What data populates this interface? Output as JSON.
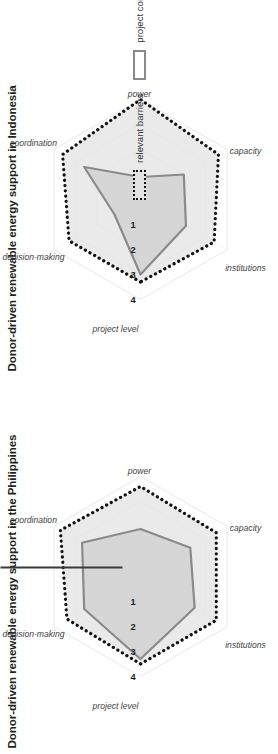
{
  "figure": {
    "background": "#ffffff",
    "orientation_note": "rotated",
    "divider": {
      "name": "panel-divider",
      "color": "#3a3a3a"
    }
  },
  "legend": {
    "items": [
      {
        "label": "relevant barriers",
        "swatch": "dotted-outline-square",
        "fill": "#e3e3e3",
        "stroke": "#111111"
      },
      {
        "label": "project contributions",
        "swatch": "solid-outline-square",
        "fill": "#ffffff",
        "stroke": "#8a8a8a"
      }
    ]
  },
  "panels": [
    {
      "id": "indonesia",
      "title": "Donor-driven renewable energy support in Indonesia"
    },
    {
      "id": "philippines",
      "title": "Donor-driven renewable energy support in the Philippines"
    }
  ],
  "chart_data": [
    {
      "type": "radar",
      "id": "indonesia",
      "title": "Donor-driven renewable energy support in Indonesia",
      "axis_title": "project level",
      "categories": [
        "project level",
        "decision-making",
        "coordination",
        "power",
        "capacity",
        "institutions"
      ],
      "tick_labels": [
        "1",
        "2",
        "3",
        "4"
      ],
      "ticks": [
        1,
        2,
        3,
        4
      ],
      "rlim": [
        0,
        4
      ],
      "grid": true,
      "legend_position": "right",
      "series": [
        {
          "name": "relevant barriers",
          "values": [
            3.3,
            3.3,
            3.6,
            4.0,
            3.6,
            3.4
          ],
          "fill": "#e3e3e3",
          "stroke": "#111111",
          "style": "dotted"
        },
        {
          "name": "project contributions",
          "values": [
            3.0,
            1.2,
            2.6,
            0.9,
            2.0,
            2.1
          ],
          "fill": "#cfcfcf",
          "stroke": "#8a8a8a",
          "style": "solid"
        }
      ]
    },
    {
      "type": "radar",
      "id": "philippines",
      "title": "Donor-driven renewable energy support in the Philippines",
      "axis_title": "project level",
      "categories": [
        "project level",
        "decision-making",
        "coordination",
        "power",
        "capacity",
        "institutions"
      ],
      "tick_labels": [
        "1",
        "2",
        "3",
        "4"
      ],
      "ticks": [
        1,
        2,
        3,
        4
      ],
      "rlim": [
        0,
        4
      ],
      "grid": true,
      "legend_position": "right",
      "series": [
        {
          "name": "relevant barriers",
          "values": [
            3.5,
            3.4,
            3.7,
            3.6,
            3.5,
            3.5
          ],
          "fill": "#e3e3e3",
          "stroke": "#111111",
          "style": "dotted"
        },
        {
          "name": "project contributions",
          "values": [
            3.3,
            2.6,
            2.7,
            1.9,
            2.3,
            2.5
          ],
          "fill": "#cfcfcf",
          "stroke": "#8a8a8a",
          "style": "solid"
        }
      ]
    }
  ]
}
